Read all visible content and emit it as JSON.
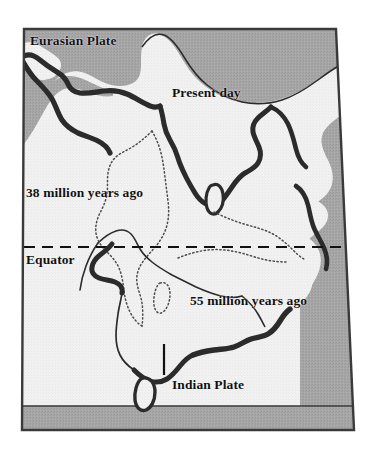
{
  "figure": {
    "background_color": "#ffffff"
  },
  "frame": {
    "name": "map-frame",
    "border_color": "#3a3a3a",
    "land_light_color": "#f0f0f0",
    "sea_gray_color": "#a3a3a3",
    "coastline_dark_color": "#2b2b2b"
  },
  "labels": {
    "eurasian_plate": "Eurasian Plate",
    "present_day": "Present day",
    "age_38ma": "38 million years ago",
    "equator": "Equator",
    "age_55ma": "55 million years ago",
    "indian_plate": "Indian Plate"
  },
  "legend_features": {
    "present_day_outline": "thick dark coastline of present-day Eurasia, Arabia and India",
    "position_38ma": "dotted outline showing India at 38 million years ago",
    "position_55ma": "thin solid outline showing India at 55 million years ago",
    "equator_line": "horizontal dashed line labelled Equator",
    "pointer_tick": "short vertical tick mark pointing to the Indian Plate label"
  },
  "colors": {
    "sea_gray": "#a3a3a3",
    "land_light": "#f0f0f0",
    "outline_dark": "#2b2b2b",
    "text": "#101010",
    "bottom_band": "#a3a3a3"
  }
}
